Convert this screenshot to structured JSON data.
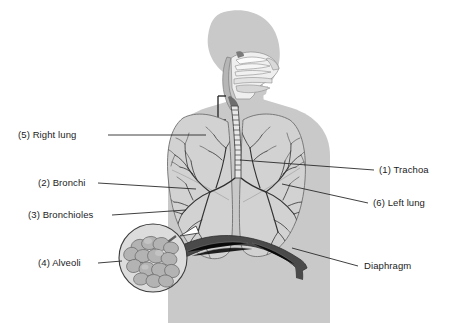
{
  "figure": {
    "background_color": "#ffffff",
    "body_fill": "#c9c9c9",
    "body_outline": "#9a9a9a",
    "lung_fill": "#d2d2d2",
    "airway_fill": "#efefef",
    "bronchi_color": "#3a3a3a",
    "diaphragm_color": "#4a4a4a",
    "label_color": "#1b1b1b",
    "leader_color": "#2a2a2a"
  },
  "labels": {
    "left": [
      {
        "id": "right-lung",
        "text": "(5) Right lung"
      },
      {
        "id": "bronchi",
        "text": "(2) Bronchi"
      },
      {
        "id": "bronchioles",
        "text": "(3) Bronchioles"
      },
      {
        "id": "alveoli",
        "text": "(4) Alveoli"
      }
    ],
    "right": [
      {
        "id": "trachea",
        "text": "(1) Trachoa"
      },
      {
        "id": "left-lung",
        "text": "(6) Left lung"
      },
      {
        "id": "diaphragm",
        "text": "Diaphragm"
      }
    ]
  },
  "parts": {
    "head": "head-profile",
    "nasal_cavity": "nasal-cavity-cutaway",
    "oral_cavity": "oral-cavity-cutaway",
    "larynx_bracket": "larynx-bracket",
    "trachea": "trachea-rings",
    "left_lung": "left-lung",
    "right_lung": "right-lung",
    "bronchial_tree": "bronchial-tree",
    "diaphragm": "diaphragm",
    "alveoli_inset": "alveoli-magnifier-circle"
  }
}
